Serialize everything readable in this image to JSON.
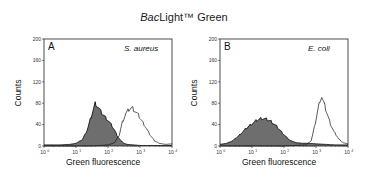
{
  "figure": {
    "title_italic": "Bac",
    "title_rest": "Light™ Green"
  },
  "chart_data": [
    {
      "type": "area",
      "title": "A — S. aureus",
      "panel_label": "A",
      "species": "S. aureus",
      "xlabel": "Green fluorescence",
      "ylabel": "Counts",
      "xscale": "log",
      "xlim": [
        1,
        10000
      ],
      "ylim": [
        0,
        200
      ],
      "xticks": [
        "10^0",
        "10^1",
        "10^2",
        "10^3",
        "10^4"
      ],
      "yticks": [
        0,
        40,
        80,
        120,
        160,
        200
      ],
      "grid": false,
      "series": [
        {
          "name": "filled (gray)",
          "x_log10": [
            0.0,
            0.5,
            0.8,
            1.0,
            1.2,
            1.35,
            1.45,
            1.55,
            1.6,
            1.65,
            1.7,
            1.8,
            1.9,
            2.0,
            2.1,
            2.2,
            2.3,
            2.4,
            2.5,
            2.6,
            2.8,
            3.0,
            4.0
          ],
          "values": [
            2,
            2,
            3,
            5,
            12,
            30,
            50,
            70,
            80,
            76,
            72,
            62,
            55,
            48,
            40,
            30,
            18,
            10,
            5,
            3,
            2,
            1,
            1
          ]
        },
        {
          "name": "outline (unfilled)",
          "x_log10": [
            0.0,
            1.5,
            2.0,
            2.2,
            2.35,
            2.45,
            2.55,
            2.65,
            2.75,
            2.85,
            2.95,
            3.05,
            3.15,
            3.3,
            3.45,
            3.6,
            3.8,
            4.0
          ],
          "values": [
            0,
            0,
            2,
            6,
            20,
            45,
            60,
            68,
            72,
            65,
            58,
            48,
            38,
            22,
            10,
            5,
            3,
            4
          ]
        }
      ]
    },
    {
      "type": "area",
      "title": "B — E. coli",
      "panel_label": "B",
      "species": "E. coli",
      "xlabel": "Green fluorescence",
      "ylabel": "Counts",
      "xscale": "log",
      "xlim": [
        1,
        10000
      ],
      "ylim": [
        0,
        200
      ],
      "xticks": [
        "10^0",
        "10^1",
        "10^2",
        "10^3",
        "10^4"
      ],
      "yticks": [
        0,
        40,
        80,
        120,
        160,
        200
      ],
      "grid": false,
      "series": [
        {
          "name": "filled (gray)",
          "x_log10": [
            0.0,
            0.2,
            0.4,
            0.6,
            0.8,
            1.0,
            1.15,
            1.3,
            1.45,
            1.6,
            1.75,
            1.9,
            2.05,
            2.2,
            2.4,
            2.6,
            2.8,
            3.0,
            3.3,
            3.6,
            4.0
          ],
          "values": [
            3,
            5,
            10,
            20,
            32,
            42,
            48,
            52,
            50,
            46,
            38,
            28,
            18,
            10,
            6,
            5,
            5,
            4,
            3,
            2,
            2
          ]
        },
        {
          "name": "outline (unfilled)",
          "x_log10": [
            0.0,
            2.0,
            2.7,
            2.85,
            2.95,
            3.05,
            3.12,
            3.18,
            3.25,
            3.35,
            3.45,
            3.55,
            3.7,
            3.85,
            4.0
          ],
          "values": [
            0,
            0,
            2,
            10,
            35,
            65,
            85,
            92,
            80,
            60,
            42,
            28,
            14,
            6,
            4
          ]
        }
      ]
    }
  ],
  "panels": [
    {
      "label": "A",
      "species": "S. aureus",
      "ylabel": "Counts",
      "xlabel": "Green fluorescence",
      "yticks": [
        "200",
        "160",
        "120",
        "80",
        "40",
        "0"
      ],
      "xtick_base": [
        "10",
        "10",
        "10",
        "10",
        "10"
      ],
      "xtick_exp": [
        "0",
        "1",
        "2",
        "3",
        "4"
      ]
    },
    {
      "label": "B",
      "species": "E. coli",
      "ylabel": "Counts",
      "xlabel": "Green fluorescence",
      "yticks": [
        "200",
        "160",
        "120",
        "80",
        "40",
        "0"
      ],
      "xtick_base": [
        "10",
        "10",
        "10",
        "10",
        "10"
      ],
      "xtick_exp": [
        "0",
        "1",
        "2",
        "3",
        "4"
      ]
    }
  ],
  "colors": {
    "fill": "#6e6e6e",
    "line": "#111111",
    "axis": "#222222"
  }
}
